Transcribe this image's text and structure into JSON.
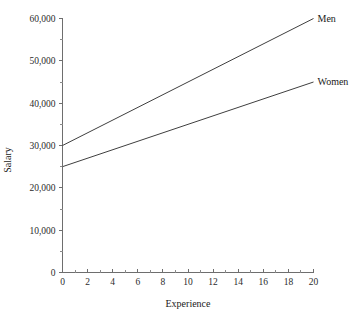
{
  "chart_data": {
    "type": "line",
    "title": "",
    "xlabel": "Experience",
    "ylabel": "Salary",
    "xlim": [
      0,
      20
    ],
    "ylim": [
      0,
      60000
    ],
    "grid": false,
    "legend_position": "line-end-labels",
    "x_ticks": [
      0,
      2,
      4,
      6,
      8,
      10,
      12,
      14,
      16,
      18,
      20
    ],
    "x_tick_labels": [
      "0",
      "2",
      "4",
      "6",
      "8",
      "10",
      "12",
      "14",
      "16",
      "18",
      "20"
    ],
    "x_minor_ticks": [
      1,
      3,
      5,
      7,
      9,
      11,
      13,
      15,
      17,
      19
    ],
    "y_ticks": [
      0,
      10000,
      20000,
      30000,
      40000,
      50000,
      60000
    ],
    "y_tick_labels": [
      "0",
      "10,000",
      "20,000",
      "30,000",
      "40,000",
      "50,000",
      "60,000"
    ],
    "y_minor_ticks": [
      5000,
      15000,
      25000,
      35000,
      45000,
      55000
    ],
    "x": [
      0,
      20
    ],
    "series": [
      {
        "name": "Men",
        "label": "Men",
        "values": [
          30000,
          60000
        ],
        "color": "#3f3f3f"
      },
      {
        "name": "Women",
        "label": "Women",
        "values": [
          25000,
          45000
        ],
        "color": "#3f3f3f"
      }
    ]
  },
  "colors": {
    "background": "#ffffff",
    "axis": "#6e6e6e",
    "line": "#3f3f3f",
    "text": "#1a1a1a"
  }
}
